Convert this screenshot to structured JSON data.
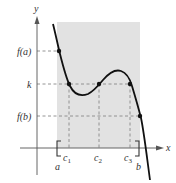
{
  "figure": {
    "axes": {
      "x_label": "x",
      "y_label": "y"
    },
    "y_labels": {
      "fa": "f(a)",
      "k": "k",
      "fb": "f(b)"
    },
    "x_labels": {
      "a": "a",
      "b": "b",
      "c1": "c",
      "c1_sub": "1",
      "c2": "c",
      "c2_sub": "2",
      "c3": "c",
      "c3_sub": "3"
    },
    "colors": {
      "shade": "#e2e2e2",
      "curve": "#111111",
      "dash": "#888888",
      "axis": "#555555"
    },
    "points": [
      {
        "name": "f(a)",
        "x": 59,
        "y": 51
      },
      {
        "name": "c1",
        "x": 69,
        "y": 84
      },
      {
        "name": "c2",
        "x": 99,
        "y": 84
      },
      {
        "name": "c3",
        "x": 130,
        "y": 84
      },
      {
        "name": "f(b)",
        "x": 140,
        "y": 116
      }
    ]
  }
}
